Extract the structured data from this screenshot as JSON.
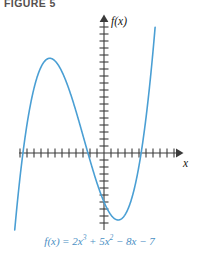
{
  "figure": {
    "label": "FIGURE 5",
    "label_color": "#55504e"
  },
  "axes": {
    "y_axis_label": "f(x)",
    "x_axis_label": "x",
    "axis_color": "#3b3b3b",
    "tick_spacing_px": 7,
    "x_axis_y_px": 153,
    "y_axis_x_px": 104,
    "x_range_px": [
      19,
      182
    ],
    "y_range_px": [
      16,
      230
    ],
    "x_tick_count": 23,
    "y_tick_count": 30,
    "grid": false
  },
  "caption": {
    "fn": "f(x)",
    "equals": "=",
    "term1_coef": "2",
    "term1_var": "x",
    "term1_exp": "3",
    "plus": "+",
    "term2_coef": "5",
    "term2_var": "x",
    "term2_exp": "2",
    "minus1": "−",
    "term3": "8x",
    "minus2": "−",
    "term4": "7",
    "full_text": "f(x) = 2x³ + 5x² − 8x − 7",
    "color": "#4a8fc4"
  },
  "chart_data": {
    "type": "line",
    "title": "FIGURE 5",
    "xlabel": "x",
    "ylabel": "f(x)",
    "equation": "f(x) = 2x^3 + 5x^2 - 8x - 7",
    "curve_color": "#4a9fd4",
    "coefficients": {
      "a": 2,
      "b": 5,
      "c": -8,
      "d": -7
    },
    "xlim": [
      -4.2,
      2.6
    ],
    "ylim": [
      -9.5,
      18.5
    ],
    "grid": false,
    "legend": null,
    "x_scale_px_per_unit": 24,
    "y_scale_px_per_unit": 7,
    "features": {
      "local_max_x": -2.08,
      "local_max_y": 12.04,
      "local_min_x": 0.64,
      "local_min_y": -10.4,
      "y_intercept": -7,
      "real_roots": [
        -3.35,
        -0.73,
        1.44
      ]
    },
    "x": [
      -4.2,
      -4.0,
      -3.8,
      -3.6,
      -3.4,
      -3.2,
      -3.0,
      -2.8,
      -2.6,
      -2.4,
      -2.2,
      -2.0,
      -1.8,
      -1.6,
      -1.4,
      -1.2,
      -1.0,
      -0.8,
      -0.6,
      -0.4,
      -0.2,
      0.0,
      0.2,
      0.4,
      0.6,
      0.8,
      1.0,
      1.2,
      1.4,
      1.6,
      1.8,
      2.0,
      2.2,
      2.4,
      2.6
    ],
    "values": [
      -21.3,
      -14.0,
      -7.6,
      -2.0,
      2.7,
      4.0,
      8.0,
      10.0,
      11.3,
      12.0,
      12.1,
      12.0,
      11.0,
      9.6,
      8.0,
      6.0,
      4.0,
      1.7,
      -0.6,
      -3.0,
      -5.2,
      -7.0,
      -8.4,
      -9.5,
      -10.2,
      -10.4,
      -8.0,
      -5.4,
      -2.0,
      2.3,
      7.7,
      14.0,
      21.5,
      30.3,
      40.5
    ]
  }
}
